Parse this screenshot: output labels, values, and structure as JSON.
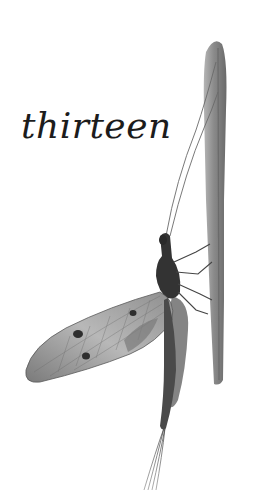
{
  "page": {
    "chapter_title": "thirteen",
    "illustration": {
      "subject": "mayfly-on-reed",
      "colors": {
        "background": "#ffffff",
        "stem": "#8c8c8c",
        "stem_dark": "#5e5e5e",
        "body": "#3a3a3a",
        "wing": "#9a9a9a",
        "wing_light": "#c4c4c4",
        "ink": "#1c1c1c"
      }
    }
  }
}
